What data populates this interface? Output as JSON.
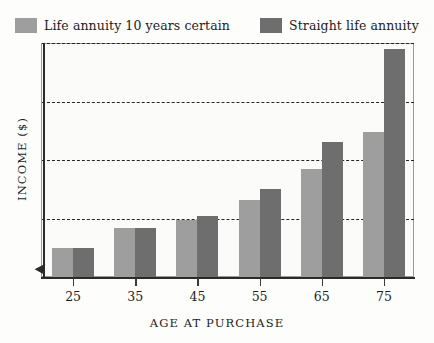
{
  "chart_data": {
    "type": "bar",
    "title": "",
    "xlabel": "AGE AT PURCHASE",
    "ylabel": "INCOME ($)",
    "categories": [
      "25",
      "35",
      "45",
      "55",
      "65",
      "75"
    ],
    "series": [
      {
        "name": "Life annuity 10 years certain",
        "color": "#9e9e9e",
        "values": [
          12.5,
          21,
          24.5,
          33,
          46,
          62
        ]
      },
      {
        "name": "Straight life annuity",
        "color": "#6e6e6e",
        "values": [
          12.5,
          21,
          26,
          37.5,
          57.5,
          97.5
        ]
      }
    ],
    "ylim": [
      0,
      100
    ],
    "gridlines": [
      25,
      50,
      75,
      100
    ],
    "grid": true,
    "grid_style": "dashed",
    "legend_position": "top"
  },
  "legend": {
    "entries": [
      {
        "label": "Life annuity 10 years certain",
        "swatch_color": "#9e9e9e"
      },
      {
        "label": "Straight life annuity",
        "swatch_color": "#6e6e6e"
      }
    ]
  },
  "axes": {
    "x_title": "AGE AT PURCHASE",
    "y_title": "INCOME ($)",
    "x_tick_labels": [
      "25",
      "35",
      "45",
      "55",
      "65",
      "75"
    ]
  },
  "colors": {
    "series_light": "#9e9e9e",
    "series_dark": "#6e6e6e",
    "frame": "#9a9a9a",
    "axis": "#2a2a2a",
    "grid": "#262626",
    "background": "#fdfdfc",
    "plot_background": "#fbfbfa"
  }
}
